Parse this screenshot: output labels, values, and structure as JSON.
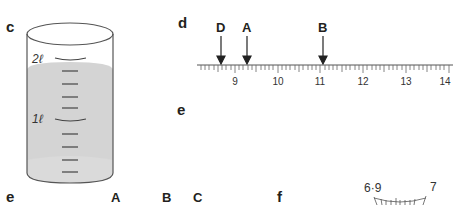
{
  "panels": {
    "c": {
      "label": "c",
      "type": "measuring-cylinder",
      "volume_labels": [
        "2ℓ",
        "1ℓ"
      ],
      "liquid_color": "#d4d4d4"
    },
    "d": {
      "label": "d",
      "type": "number-line",
      "arrows": [
        {
          "label": "D",
          "value": 8.7
        },
        {
          "label": "A",
          "value": 9.3
        },
        {
          "label": "B",
          "value": 11.1
        }
      ],
      "tick_labels": [
        "9",
        "10",
        "11",
        "12",
        "13",
        "14"
      ]
    },
    "e_mid": {
      "label": "e"
    },
    "e_bottom": {
      "label": "e",
      "letters": [
        "A",
        "B",
        "C"
      ]
    },
    "f": {
      "label": "f",
      "dial_labels": [
        "6·9",
        "7"
      ]
    }
  }
}
